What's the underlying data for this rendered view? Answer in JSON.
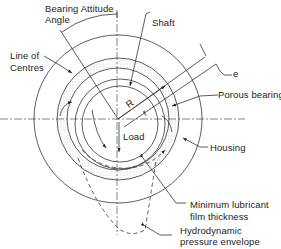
{
  "diagram": {
    "labels": {
      "attitude_angle_1": "Bearing Attitude",
      "attitude_angle_2": "Angle",
      "shaft": "Shaft",
      "line_of_centres_1": "Line of",
      "line_of_centres_2": "Centres",
      "e": "e",
      "porous_bearing": "Porous bearing",
      "R": "R",
      "r": "r",
      "load": "Load",
      "housing": "Housing",
      "min_film_1": "Minimum lubricant",
      "min_film_2": "film thickness",
      "pressure_env_1": "Hydrodynamic",
      "pressure_env_2": "pressure envelope"
    },
    "colors": {
      "line": "#333333",
      "stipple": "#9a9a9a",
      "background": "#ffffff"
    }
  }
}
